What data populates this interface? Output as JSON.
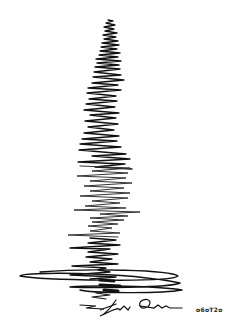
{
  "artwork": {
    "type": "seismograph-style ink drawing",
    "ink_color": "#111111",
    "background": "#ffffff"
  },
  "signature": {
    "date_text": "o6oT2o"
  }
}
